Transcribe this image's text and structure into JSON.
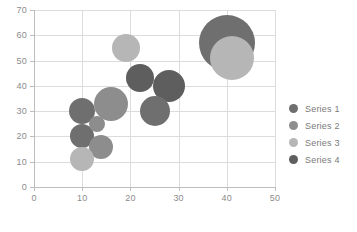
{
  "chart_data": {
    "type": "scatter",
    "title": "",
    "xlabel": "",
    "ylabel": "",
    "xlim": [
      0,
      50
    ],
    "ylim": [
      0,
      70
    ],
    "xticks": [
      0,
      10,
      20,
      30,
      40,
      50
    ],
    "yticks": [
      0,
      10,
      20,
      30,
      40,
      50,
      60,
      70
    ],
    "grid": true,
    "legend_position": "right",
    "series": [
      {
        "name": "Series 1",
        "color": "#6f6f6f",
        "points": [
          {
            "x": 10,
            "y": 20,
            "size": 12
          },
          {
            "x": 10,
            "y": 30,
            "size": 13
          },
          {
            "x": 25,
            "y": 30,
            "size": 15
          },
          {
            "x": 40,
            "y": 57,
            "size": 28
          }
        ]
      },
      {
        "name": "Series 2",
        "color": "#8d8d8d",
        "points": [
          {
            "x": 14,
            "y": 16,
            "size": 12
          },
          {
            "x": 16,
            "y": 33,
            "size": 17
          },
          {
            "x": 13,
            "y": 25,
            "size": 8
          }
        ]
      },
      {
        "name": "Series 3",
        "color": "#b6b6b6",
        "points": [
          {
            "x": 10,
            "y": 11,
            "size": 12
          },
          {
            "x": 19,
            "y": 55,
            "size": 14
          },
          {
            "x": 41,
            "y": 51,
            "size": 22
          }
        ]
      },
      {
        "name": "Series 4",
        "color": "#5e5e5e",
        "points": [
          {
            "x": 22,
            "y": 43,
            "size": 14
          },
          {
            "x": 28,
            "y": 40,
            "size": 16
          }
        ]
      }
    ]
  },
  "legend": {
    "items": [
      {
        "label": "Series 1",
        "color": "#6f6f6f"
      },
      {
        "label": "Series 2",
        "color": "#8d8d8d"
      },
      {
        "label": "Series 3",
        "color": "#b6b6b6"
      },
      {
        "label": "Series 4",
        "color": "#5e5e5e"
      }
    ]
  },
  "axes": {
    "x_tick_labels": [
      "0",
      "10",
      "20",
      "30",
      "40",
      "50"
    ],
    "y_tick_labels": [
      "0",
      "10",
      "20",
      "30",
      "40",
      "50",
      "60",
      "70"
    ]
  }
}
